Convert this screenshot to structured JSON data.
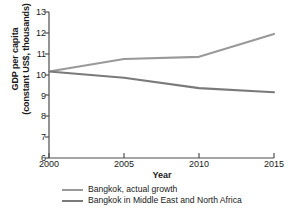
{
  "chart_data": {
    "type": "line",
    "title": "",
    "xlabel": "Year",
    "ylabel_line1": "GDP per capita",
    "ylabel_line2": "(constant US$, thousands)",
    "x": [
      2000,
      2005,
      2010,
      2015
    ],
    "xticks": [
      "2000",
      "2005",
      "2010",
      "2015"
    ],
    "yticks": [
      "13",
      "12",
      "11",
      "10",
      "9",
      "8",
      "7",
      "6"
    ],
    "xlim": [
      2000,
      2015
    ],
    "ylim": [
      6,
      13
    ],
    "grid": false,
    "legend_position": "below",
    "series": [
      {
        "name": "Bangkok, actual growth",
        "color": "#999999",
        "values": [
          10.15,
          10.75,
          10.85,
          11.95
        ]
      },
      {
        "name": "Bangkok in Middle East and North Africa",
        "color": "#7a7a7a",
        "values": [
          10.15,
          9.85,
          9.35,
          9.15
        ]
      }
    ]
  },
  "axis": {
    "color": "#4d4d4d"
  }
}
